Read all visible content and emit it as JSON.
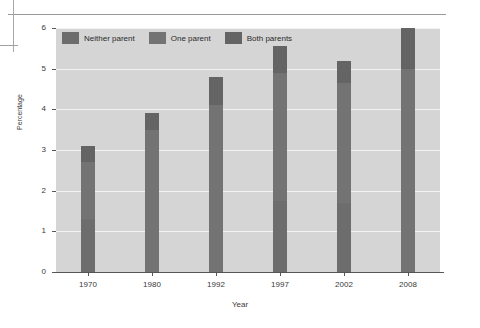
{
  "chart_data": {
    "type": "bar",
    "subtype": "stacked-bar",
    "title": "",
    "xlabel": "Year",
    "ylabel": "Percentage",
    "categories": [
      "1970",
      "1980",
      "1992",
      "1997",
      "2002",
      "2008"
    ],
    "ylim": [
      0,
      6
    ],
    "yticks": [
      "0",
      "1",
      "2",
      "3",
      "4",
      "5",
      "6"
    ],
    "grid": true,
    "legend_position": "top-left-inside",
    "series": [
      {
        "name": "Both parents",
        "color": "#646464",
        "values": [
          0.4,
          0.4,
          0.7,
          0.65,
          0.55,
          1.0
        ]
      },
      {
        "name": "One parent",
        "color": "#737373",
        "values": [
          1.4,
          3.5,
          4.1,
          3.15,
          2.95,
          5.0
        ]
      },
      {
        "name": "Neither parent",
        "color": "#6d6d6d",
        "values": [
          1.3,
          0.0,
          0.0,
          1.75,
          1.7,
          0.0
        ]
      }
    ],
    "totals": [
      3.1,
      3.9,
      4.8,
      5.55,
      5.2,
      6.0
    ],
    "cumulative_boundaries": [
      [
        0.4,
        1.8,
        3.1
      ],
      [
        0.4,
        3.9,
        3.9
      ],
      [
        0.7,
        4.8,
        4.8
      ],
      [
        0.65,
        3.8,
        5.55
      ],
      [
        0.55,
        3.5,
        5.2
      ],
      [
        1.0,
        6.0,
        6.0
      ]
    ]
  },
  "legend": {
    "items": [
      {
        "label": "Neither parent",
        "color": "#6d6d6d"
      },
      {
        "label": "One parent",
        "color": "#737373"
      },
      {
        "label": "Both parents",
        "color": "#646464"
      }
    ]
  },
  "axes": {
    "y_title": "Percentage",
    "x_title": "Year"
  },
  "colors": {
    "plot_background": "#d5d5d5",
    "gridline": "#f2f2f2",
    "axis": "#555555",
    "bar": "#6d6d6d",
    "page_background": "#ffffff"
  }
}
